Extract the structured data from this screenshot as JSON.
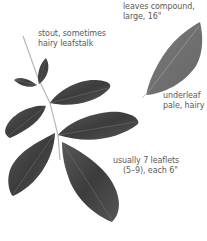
{
  "colors": {
    "background": "#ffffff",
    "leaf_upper": "#4a4a4a",
    "leaf_upper_dark": "#333333",
    "leaf_under": "#6e6e6e",
    "stalk": "#b8b8b8",
    "vein": "#9a9a9a",
    "label_text": "#5a5a5a"
  },
  "labels": {
    "compound": {
      "line1": "leaves compound,",
      "line2": "large, 16\""
    },
    "stalk": {
      "line1": "stout, sometimes",
      "line2": "hairy leafstalk"
    },
    "underleaf": {
      "line1": "underleaf",
      "line2": "pale, hairy"
    },
    "leaflets": {
      "line1": "usually 7 leaflets",
      "line2": "(5–9), each 6\""
    }
  }
}
